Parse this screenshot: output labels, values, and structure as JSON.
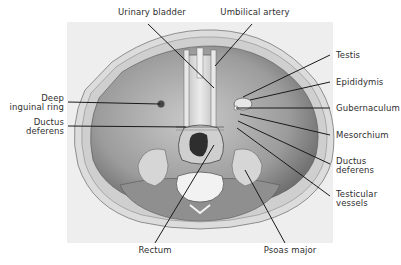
{
  "figure": {
    "background_color": "#eeeeee",
    "line_color": "#1a1a1a"
  },
  "labels": {
    "urinary_bladder": "Urinary bladder",
    "umbilical_artery": "Umbilical artery",
    "testis": "Testis",
    "epididymis": "Epididymis",
    "gubernaculum": "Gubernaculum",
    "mesorchium": "Mesorchium",
    "ductus_deferens_right_1": "Ductus",
    "ductus_deferens_right_2": "deferens",
    "testicular_vessels_1": "Testicular",
    "testicular_vessels_2": "vessels",
    "deep_inguinal_ring_1": "Deep",
    "deep_inguinal_ring_2": "inguinal ring",
    "ductus_deferens_left_1": "Ductus",
    "ductus_deferens_left_2": "deferens",
    "rectum": "Rectum",
    "psoas_major": "Psoas major"
  }
}
